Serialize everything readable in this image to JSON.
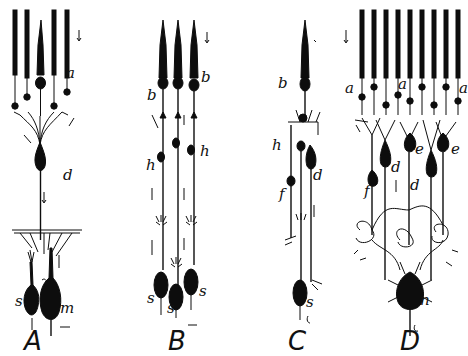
{
  "figure": {
    "background": "#ffffff",
    "ink_color": "#0d0d0d",
    "panels": [
      {
        "id": "A",
        "label": "A",
        "cell_labels": [
          {
            "text": "a",
            "x": 66,
            "y": 78
          },
          {
            "text": "d",
            "x": 63,
            "y": 180
          },
          {
            "text": "s",
            "x": 17,
            "y": 306
          },
          {
            "text": "m",
            "x": 60,
            "y": 313
          }
        ]
      },
      {
        "id": "B",
        "label": "B",
        "cell_labels": [
          {
            "text": "b",
            "x": 199,
            "y": 82
          },
          {
            "text": "b",
            "x": 148,
            "y": 100
          },
          {
            "text": "h",
            "x": 146,
            "y": 168
          },
          {
            "text": "h",
            "x": 199,
            "y": 156
          },
          {
            "text": "s",
            "x": 148,
            "y": 303
          },
          {
            "text": "s",
            "x": 168,
            "y": 313
          },
          {
            "text": "s",
            "x": 198,
            "y": 295
          }
        ]
      },
      {
        "id": "C",
        "label": "C",
        "cell_labels": [
          {
            "text": "b",
            "x": 279,
            "y": 88
          },
          {
            "text": "h",
            "x": 273,
            "y": 148
          },
          {
            "text": "f",
            "x": 279,
            "y": 199
          },
          {
            "text": "d",
            "x": 311,
            "y": 180
          },
          {
            "text": "s",
            "x": 305,
            "y": 307
          }
        ]
      },
      {
        "id": "D",
        "label": "D",
        "cell_labels": [
          {
            "text": "a",
            "x": 347,
            "y": 92
          },
          {
            "text": "a",
            "x": 398,
            "y": 88
          },
          {
            "text": "a",
            "x": 460,
            "y": 92
          },
          {
            "text": "e",
            "x": 415,
            "y": 153
          },
          {
            "text": "e",
            "x": 451,
            "y": 153
          },
          {
            "text": "d",
            "x": 388,
            "y": 170
          },
          {
            "text": "d",
            "x": 410,
            "y": 189
          },
          {
            "text": "f",
            "x": 367,
            "y": 194
          },
          {
            "text": "n",
            "x": 419,
            "y": 304
          }
        ]
      }
    ]
  }
}
